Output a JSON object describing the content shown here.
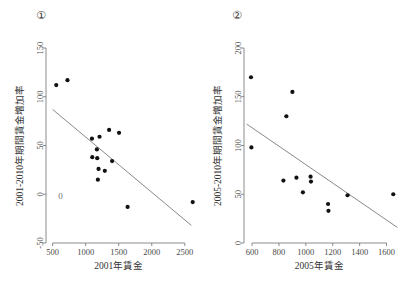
{
  "figure": {
    "background": "#ffffff",
    "point_color": "#111111",
    "line_color": "#7a7a7a",
    "axis_color": "#6f6f6f",
    "width": 408,
    "height": 291
  },
  "panels": [
    {
      "marker": "①",
      "name": "panel-1",
      "inner_zero_label": "0"
    },
    {
      "marker": "②",
      "name": "panel-2",
      "inner_zero_label": ""
    }
  ],
  "chart_data": [
    {
      "type": "scatter",
      "title": "①",
      "xlabel": "2001年賃金",
      "ylabel": "2001-2010年期間賃金増加率",
      "xlim": [
        400,
        2700
      ],
      "ylim": [
        -50,
        150
      ],
      "xticks": [
        500,
        1000,
        1500,
        2000,
        2500
      ],
      "xticklabels": [
        "500",
        "1000",
        "1500",
        "2000",
        "2500"
      ],
      "yticks": [
        -50,
        0,
        50,
        100,
        150
      ],
      "yticklabels": [
        "-50",
        "0",
        "50",
        "100",
        "150"
      ],
      "grid": false,
      "legend": false,
      "annotations": [
        {
          "text": "0",
          "x": 620,
          "y": -2
        }
      ],
      "points": [
        {
          "x": 555,
          "y": 112
        },
        {
          "x": 725,
          "y": 117
        },
        {
          "x": 1095,
          "y": 57
        },
        {
          "x": 1100,
          "y": 38
        },
        {
          "x": 1170,
          "y": 46
        },
        {
          "x": 1175,
          "y": 37
        },
        {
          "x": 1185,
          "y": 15
        },
        {
          "x": 1195,
          "y": 26
        },
        {
          "x": 1210,
          "y": 59
        },
        {
          "x": 1290,
          "y": 24
        },
        {
          "x": 1355,
          "y": 66
        },
        {
          "x": 1400,
          "y": 34
        },
        {
          "x": 1505,
          "y": 63
        },
        {
          "x": 1635,
          "y": -13
        },
        {
          "x": 2620,
          "y": -8
        }
      ],
      "fit_line": {
        "x1": 500,
        "y1": 87,
        "x2": 2600,
        "y2": -32
      }
    },
    {
      "type": "scatter",
      "title": "②",
      "xlabel": "2005年賃金",
      "ylabel": "2005-2010年期間賃金増加率",
      "xlim": [
        540,
        1700
      ],
      "ylim": [
        0,
        200
      ],
      "xticks": [
        600,
        800,
        1000,
        1200,
        1400,
        1600
      ],
      "xticklabels": [
        "600",
        "800",
        "1000",
        "1200",
        "1400",
        "1600"
      ],
      "yticks": [
        0,
        50,
        100,
        150,
        200
      ],
      "yticklabels": [
        "0",
        "50",
        "100",
        "150",
        "200"
      ],
      "grid": false,
      "legend": false,
      "annotations": [],
      "points": [
        {
          "x": 592,
          "y": 170
        },
        {
          "x": 595,
          "y": 98
        },
        {
          "x": 855,
          "y": 130
        },
        {
          "x": 833,
          "y": 64
        },
        {
          "x": 900,
          "y": 155
        },
        {
          "x": 930,
          "y": 67
        },
        {
          "x": 978,
          "y": 52
        },
        {
          "x": 1035,
          "y": 68
        },
        {
          "x": 1038,
          "y": 63
        },
        {
          "x": 1165,
          "y": 40
        },
        {
          "x": 1168,
          "y": 33
        },
        {
          "x": 1310,
          "y": 49
        },
        {
          "x": 1650,
          "y": 50
        }
      ],
      "fit_line": {
        "x1": 560,
        "y1": 122,
        "x2": 1680,
        "y2": 16
      }
    }
  ]
}
